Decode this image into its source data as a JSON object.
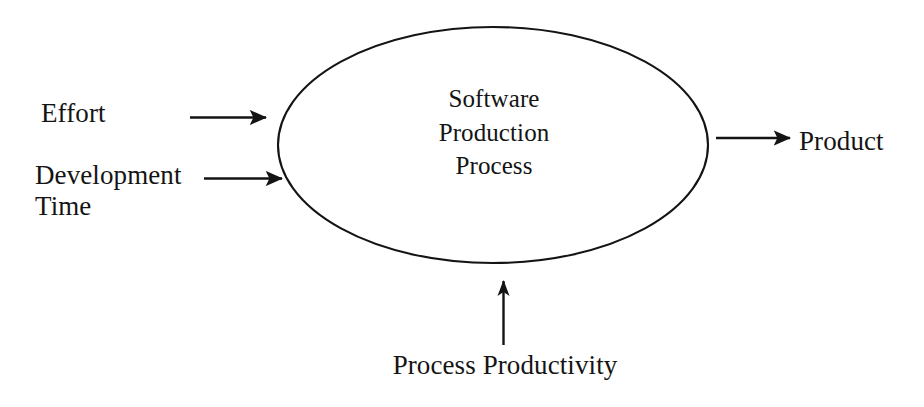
{
  "diagram": {
    "type": "input-process-output flow diagram",
    "background_color": "#ffffff",
    "stroke_color": "#141414",
    "text_color": "#141414",
    "process": {
      "shape": "ellipse",
      "label_lines": [
        "Software",
        "Production",
        "Process"
      ],
      "label_line_1": "Software",
      "label_line_2": "Production",
      "label_line_3": "Process"
    },
    "inputs": [
      {
        "label": "Effort",
        "direction": "right",
        "enters": "left side of ellipse"
      },
      {
        "label": "Development\nTime",
        "label_line_1": "Development",
        "label_line_2": "Time",
        "direction": "right",
        "enters": "left side of ellipse"
      },
      {
        "label": "Process Productivity",
        "direction": "up",
        "enters": "bottom of ellipse"
      }
    ],
    "outputs": [
      {
        "label": "Product",
        "direction": "right",
        "exits": "right side of ellipse"
      }
    ],
    "labels": {
      "effort": "Effort",
      "development": "Development",
      "time": "Time",
      "product": "Product",
      "process_productivity": "Process Productivity"
    }
  }
}
